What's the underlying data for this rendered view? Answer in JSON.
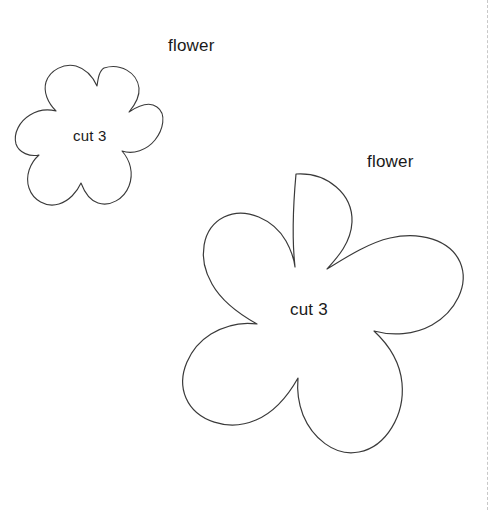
{
  "page": {
    "background_color": "#ffffff",
    "ink_color": "#1a1a1a",
    "width": 502,
    "height": 510
  },
  "fold_line": {
    "name": "fold-guide",
    "style": "dashed",
    "color": "#c8c8c8",
    "orientation": "vertical",
    "x": 487
  },
  "patterns": [
    {
      "id": "flower-small",
      "title": "flower",
      "quantity_label": "cut 3",
      "petals": 5,
      "bounds": {
        "x": 25,
        "y": 66,
        "width": 136,
        "height": 142
      },
      "outline_color": "#3a3a3a",
      "fill_color": "#ffffff",
      "stroke_width": 1.1
    },
    {
      "id": "flower-large",
      "title": "flower",
      "quantity_label": "cut 3",
      "petals": 5,
      "bounds": {
        "x": 133,
        "y": 173,
        "width": 333,
        "height": 323
      },
      "outline_color": "#3a3a3a",
      "fill_color": "#ffffff",
      "stroke_width": 1.2
    }
  ]
}
